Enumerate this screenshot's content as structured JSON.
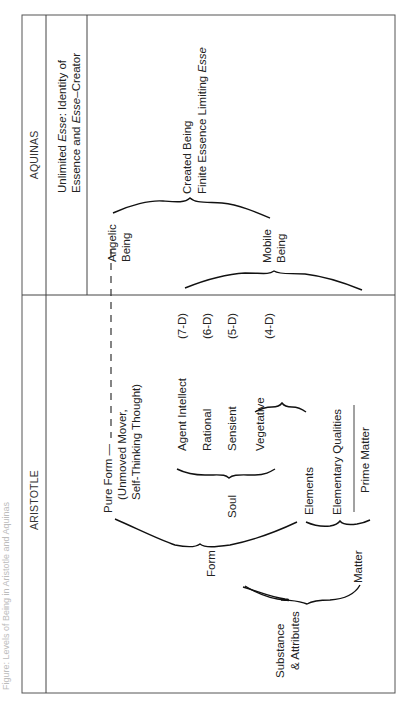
{
  "caption": "Figure: Levels of Being in Aristotle and Aquinas",
  "columns": {
    "aquinas": "AQUINAS",
    "aristotle": "ARISTOTLE"
  },
  "aquinas": {
    "unlimited_line1": "Unlimited ",
    "unlimited_esse": "Esse",
    "unlimited_line1_rest": ": Identity of",
    "unlimited_line2_a": "Essence and ",
    "unlimited_line2_esse": "Esse",
    "unlimited_line2_b": "–Creator",
    "created_being": "Created Being",
    "finite_essence": "Finite Essence Limiting ",
    "finite_esse": "Esse",
    "angelic_1": "Angelic",
    "angelic_2": "Being",
    "mobile_1": "Mobile",
    "mobile_2": "Being"
  },
  "aristotle": {
    "pure_form": "Pure Form —",
    "unmoved_mover": "(Unmoved Mover,",
    "self_thinking": "Self-Thinking Thought)",
    "agent_intellect": "Agent Intellect",
    "rational": "Rational",
    "sensient": "Sensient",
    "vegetative": "Vegetative",
    "soul": "Soul",
    "form": "Form",
    "elements": "Elements",
    "elementary_qualities": "Elementary Qualities",
    "prime_matter": "Prime Matter",
    "matter": "Matter",
    "substance_1": "Substance",
    "substance_2": "& Attributes",
    "degrees": [
      "(7-D)",
      "(6-D)",
      "(5-D)",
      "(4-D)"
    ]
  }
}
